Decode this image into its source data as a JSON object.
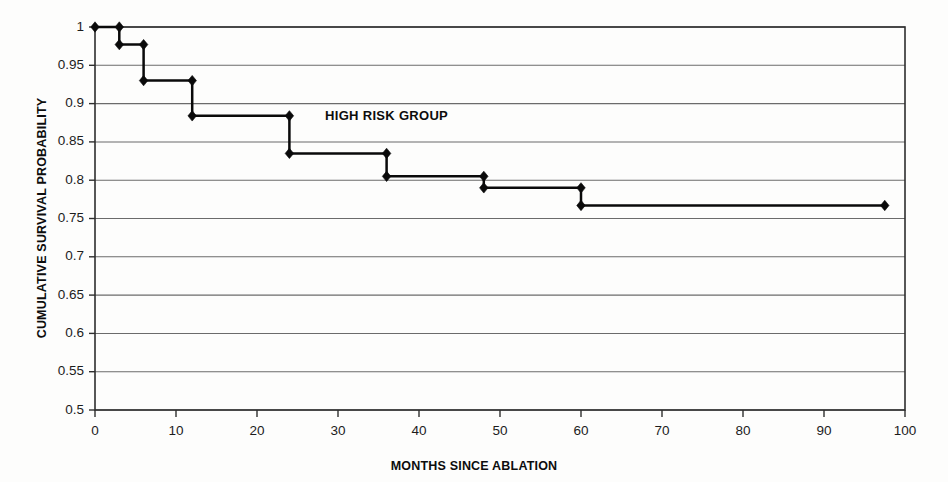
{
  "chart_data": {
    "type": "line",
    "title": "",
    "subtitle": "",
    "xlabel": "MONTHS SINCE ABLATION",
    "ylabel": "CUMULATIVE SURVIVAL PROBABILITY",
    "xlim": [
      0,
      100
    ],
    "ylim": [
      0.5,
      1
    ],
    "grid": "horizontal",
    "legend": "none",
    "step_style": "post",
    "x_ticks": [
      0,
      10,
      20,
      30,
      40,
      50,
      60,
      70,
      80,
      90,
      100
    ],
    "x_tick_labels": [
      "0",
      "10",
      "20",
      "30",
      "40",
      "50",
      "60",
      "70",
      "80",
      "90",
      "100"
    ],
    "y_ticks": [
      0.5,
      0.55,
      0.6,
      0.65,
      0.7,
      0.75,
      0.8,
      0.85,
      0.9,
      0.95,
      1
    ],
    "y_tick_labels": [
      "0.5",
      "0.55",
      "0.6",
      "0.65",
      "0.7",
      "0.75",
      "0.8",
      "0.85",
      "0.9",
      "0.95",
      "1"
    ],
    "series": [
      {
        "name": "HIGH RISK GROUP",
        "color": "#0a0a0a",
        "marker": "diamond",
        "x": [
          0,
          3,
          3,
          6,
          6,
          12,
          12,
          24,
          24,
          36,
          36,
          48,
          48,
          60,
          60,
          97.5
        ],
        "y": [
          1,
          1,
          0.977,
          0.977,
          0.93,
          0.93,
          0.884,
          0.884,
          0.835,
          0.835,
          0.805,
          0.805,
          0.79,
          0.79,
          0.767,
          0.767
        ],
        "points": [
          {
            "x": 0,
            "y": 1
          },
          {
            "x": 3,
            "y": 1
          },
          {
            "x": 3,
            "y": 0.977
          },
          {
            "x": 6,
            "y": 0.977
          },
          {
            "x": 6,
            "y": 0.93
          },
          {
            "x": 12,
            "y": 0.93
          },
          {
            "x": 12,
            "y": 0.884
          },
          {
            "x": 24,
            "y": 0.884
          },
          {
            "x": 24,
            "y": 0.835
          },
          {
            "x": 36,
            "y": 0.835
          },
          {
            "x": 36,
            "y": 0.805
          },
          {
            "x": 48,
            "y": 0.805
          },
          {
            "x": 48,
            "y": 0.79
          },
          {
            "x": 60,
            "y": 0.79
          },
          {
            "x": 60,
            "y": 0.767
          },
          {
            "x": 97.5,
            "y": 0.767
          }
        ]
      }
    ],
    "annotations": [
      {
        "text": "HIGH RISK GROUP",
        "x": 36,
        "y": 0.878
      }
    ]
  }
}
